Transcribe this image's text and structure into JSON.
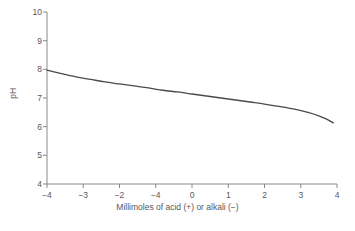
{
  "chart_data": {
    "type": "line",
    "title": "",
    "subtitle": "",
    "xlabel": "Millimoles of acid (+) or alkali (−)",
    "ylabel": "pH",
    "xlim": [
      -4,
      4
    ],
    "ylim": [
      4,
      10
    ],
    "grid": false,
    "legend": null,
    "xticks": [
      -4,
      -3,
      -2,
      -1,
      0,
      1,
      2,
      3,
      4
    ],
    "xtick_labels": [
      "−4",
      "−3",
      "−2",
      "−4",
      "0",
      "1",
      "2",
      "3",
      "4"
    ],
    "yticks": [
      4,
      5,
      6,
      7,
      8,
      9,
      10
    ],
    "ytick_labels": [
      "4",
      "5",
      "6",
      "7",
      "8",
      "9",
      "10"
    ],
    "line_color": "#4a4a4c",
    "axis_color": "#8a8a8c",
    "background_color": "#ffffff",
    "series": [
      {
        "name": "pH titration curve",
        "x": [
          -4.0,
          -3.6,
          -3.2,
          -2.8,
          -2.4,
          -2.0,
          -1.6,
          -1.2,
          -0.8,
          -0.4,
          0.0,
          0.4,
          0.8,
          1.2,
          1.6,
          2.0,
          2.4,
          2.8,
          3.2,
          3.5,
          3.7,
          3.9
        ],
        "y": [
          7.97,
          7.85,
          7.74,
          7.65,
          7.56,
          7.49,
          7.42,
          7.35,
          7.27,
          7.21,
          7.14,
          7.07,
          7.0,
          6.93,
          6.86,
          6.79,
          6.71,
          6.62,
          6.5,
          6.38,
          6.27,
          6.13
        ]
      }
    ]
  },
  "axes": {
    "y_axis_name": "pH-axis",
    "x_axis_name": "millimoles-axis"
  }
}
